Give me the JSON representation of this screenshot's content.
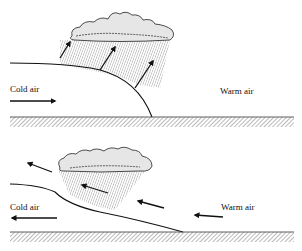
{
  "panels": [
    {
      "id": "top",
      "name": "warm-front",
      "labels": {
        "cold": "Cold air",
        "warm": "Warm air"
      }
    },
    {
      "id": "bottom",
      "name": "cold-front",
      "labels": {
        "cold": "Cold air",
        "warm": "Warm air"
      }
    }
  ],
  "colors": {
    "ink": "#111111",
    "hatch": "#555555",
    "cloud_fill": "#e6e6e6",
    "rain": "#888888"
  }
}
